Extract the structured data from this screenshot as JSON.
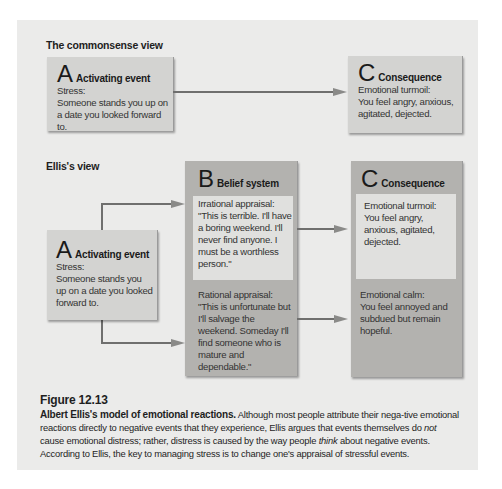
{
  "figure": {
    "number": "Figure 12.13",
    "caption_bold": "Albert Ellis's model of emotional reactions.",
    "caption_part1": " Although most people attribute their nega-tive emotional reactions directly to negative events that they experience, Ellis argues that events themselves do ",
    "caption_em1": "not",
    "caption_part2": " cause emotional distress; rather, distress is caused by the way people ",
    "caption_em2": "think",
    "caption_part3": " about negative events. According to Ellis, the key to managing stress is to change one's appraisal of stressful events."
  },
  "commonsense": {
    "title": "The commonsense view",
    "a": {
      "letter": "A",
      "label": "Activating event",
      "line1": "Stress:",
      "line2": "Someone stands you up on a date you looked forward to."
    },
    "c": {
      "letter": "C",
      "label": "Consequence",
      "line1": "Emotional turmoil:",
      "line2": "You feel angry, anxious, agitated, dejected."
    }
  },
  "ellis": {
    "title": "Ellis's view",
    "a": {
      "letter": "A",
      "label": "Activating event",
      "line1": "Stress:",
      "line2": "Someone stands you up on a date you looked forward to."
    },
    "b": {
      "letter": "B",
      "label": "Belief system",
      "irrational_label": "Irrational appraisal:",
      "irrational_text": "\"This is terrible. I'll have a boring weekend. I'll never find anyone. I must be a worthless person.\"",
      "rational_label": "Rational appraisal:",
      "rational_text": "\"This is unfortunate but I'll salvage the weekend. Someday I'll find someone who is mature and dependable.\""
    },
    "c": {
      "letter": "C",
      "label": "Consequence",
      "turmoil_label": "Emotional turmoil:",
      "turmoil_text": "You feel angry, anxious, agitated, dejected.",
      "calm_label": "Emotional calm:",
      "calm_text": "You feel annoyed and subdued but remain hopeful."
    }
  },
  "colors": {
    "panel": "#ebebea",
    "box_light": "#d3d3d1",
    "box_dark": "#b3b2af",
    "inner": "#e0e0de",
    "arrow": "#6f6f6e"
  }
}
